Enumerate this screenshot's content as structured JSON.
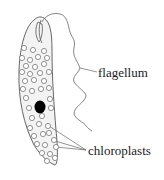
{
  "diagram": {
    "labels": {
      "flagellum": "flagellum",
      "chloroplasts": "chloroplasts"
    },
    "colors": {
      "cell_fill": "#f3f3f3",
      "outline": "#555555",
      "nucleus": "#000000",
      "text": "#1a1a1a"
    }
  }
}
